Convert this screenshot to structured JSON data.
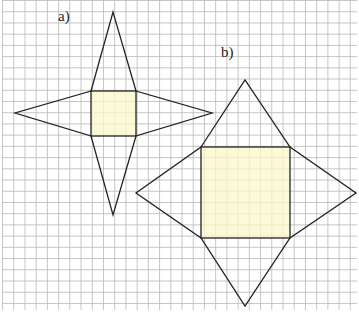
{
  "labels": {
    "a": "a)",
    "b": "b)"
  },
  "colors": {
    "grid": "#b8b8b8",
    "fill": "#fbf8c8",
    "stroke": "#222222"
  },
  "figures": [
    {
      "name": "figure-a",
      "label": "a)",
      "square": [
        91,
        91,
        136,
        136
      ],
      "apexes": [
        [
          113,
          12
        ],
        [
          15,
          113
        ],
        [
          212,
          113
        ],
        [
          113,
          215
        ]
      ]
    },
    {
      "name": "figure-b",
      "label": "b)",
      "square": [
        201,
        147,
        290,
        238
      ],
      "apexes": [
        [
          245,
          80
        ],
        [
          136,
          193
        ],
        [
          356,
          193
        ],
        [
          245,
          306
        ]
      ]
    }
  ]
}
